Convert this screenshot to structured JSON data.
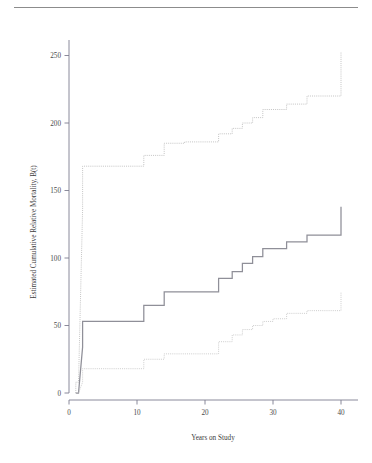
{
  "figure": {
    "background": "#ffffff",
    "top_rule_color": "#8c8c8c"
  },
  "chart_data": {
    "type": "line",
    "title": "",
    "subtitle": "",
    "xlabel": "Years on Study",
    "ylabel": "Estimated Cumulative Relative Mortality, B(t)",
    "xlim": [
      -1.2,
      41.5
    ],
    "ylim": [
      -12,
      272
    ],
    "xticks": [
      0,
      10,
      20,
      30,
      40
    ],
    "xticklabels": [
      "0",
      "10",
      "20",
      "30",
      "40"
    ],
    "yticks": [
      0,
      50,
      100,
      150,
      200,
      250
    ],
    "yticklabels": [
      "0",
      "50",
      "100",
      "150",
      "200",
      "250"
    ],
    "grid": false,
    "legend": null,
    "legend_position": "none",
    "step_shape": "post",
    "annotations": [],
    "series": [
      {
        "name": "upper-confidence-bound",
        "style": "step",
        "linestyle": "dotted",
        "color": "#b5b5b5",
        "linewidth": 0.8,
        "x": [
          1,
          1,
          1.4,
          2,
          2,
          11,
          11,
          14,
          14,
          17,
          17,
          19,
          19,
          22,
          22,
          24,
          24,
          25.5,
          25.5,
          27,
          27,
          28.5,
          28.5,
          32,
          32,
          35,
          35,
          40,
          40
        ],
        "y": [
          0,
          8,
          8,
          136,
          168,
          168,
          176,
          176,
          185,
          185,
          186,
          186,
          186,
          186,
          192,
          192,
          196,
          196,
          200,
          200,
          204,
          204,
          210,
          210,
          214,
          214,
          220,
          220,
          253
        ]
      },
      {
        "name": "point-estimate",
        "style": "step",
        "linestyle": "solid",
        "color": "#8f8f98",
        "linewidth": 1.25,
        "x": [
          1,
          1,
          1.4,
          2,
          2,
          11,
          11,
          14,
          14,
          22,
          22,
          24,
          24,
          25.5,
          25.5,
          27,
          27,
          28.5,
          28.5,
          32,
          32,
          35,
          35,
          40,
          40
        ],
        "y": [
          0,
          0,
          0,
          34,
          53,
          53,
          65,
          65,
          75,
          75,
          85,
          85,
          90,
          90,
          96,
          96,
          101,
          101,
          107,
          107,
          112,
          112,
          117,
          117,
          138
        ]
      },
      {
        "name": "lower-confidence-bound",
        "style": "step",
        "linestyle": "dotted",
        "color": "#c2c2c2",
        "linewidth": 0.8,
        "x": [
          1,
          1,
          1.4,
          2,
          2,
          11,
          11,
          14,
          14,
          22,
          22,
          24,
          24,
          25.5,
          25.5,
          27,
          27,
          28.5,
          28.5,
          30,
          30,
          32,
          32,
          35,
          35,
          40,
          40
        ],
        "y": [
          0,
          0,
          0,
          8,
          18,
          18,
          25,
          25,
          29,
          29,
          38,
          38,
          43,
          43,
          47,
          47,
          50,
          50,
          53,
          53,
          55,
          55,
          59,
          59,
          61,
          61,
          75
        ]
      }
    ]
  }
}
